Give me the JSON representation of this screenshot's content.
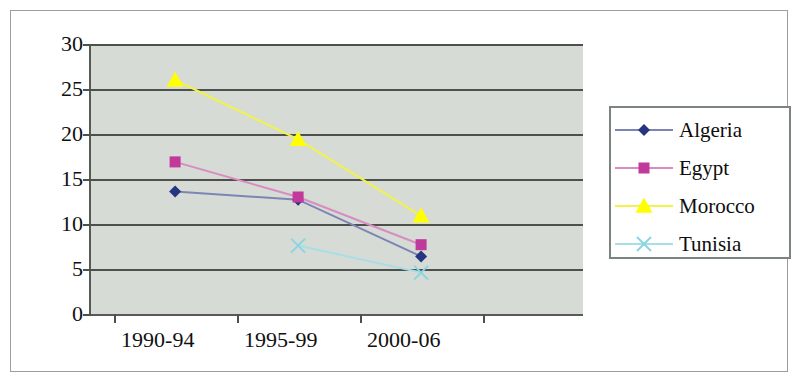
{
  "chart_data": {
    "type": "line",
    "title": "",
    "xlabel": "",
    "ylabel": "",
    "categories": [
      "1990-94",
      "1995-99",
      "2000-06"
    ],
    "ylim": [
      0,
      30
    ],
    "yticks": [
      0,
      5,
      10,
      15,
      20,
      25,
      30
    ],
    "ytick_labels": [
      "0",
      "5",
      "10",
      "15",
      "20",
      "25",
      "30"
    ],
    "grid": true,
    "legend_position": "right",
    "series": [
      {
        "name": "Algeria",
        "color": "#26357f",
        "line_color": "#7d85b5",
        "marker": "diamond",
        "values": [
          13.6,
          12.7,
          6.4
        ]
      },
      {
        "name": "Egypt",
        "color": "#c0399b",
        "line_color": "#d98cc0",
        "marker": "square",
        "values": [
          16.9,
          13.0,
          7.7
        ]
      },
      {
        "name": "Morocco",
        "color": "#ffff00",
        "line_color": "#f2f24d",
        "marker": "triangle",
        "values": [
          26.0,
          19.4,
          10.9
        ]
      },
      {
        "name": "Tunisia",
        "color": "#8ad6e0",
        "line_color": "#a8dee6",
        "marker": "x",
        "values": [
          null,
          7.6,
          4.6
        ]
      }
    ]
  },
  "axes": {
    "y_tick_labels": [
      "30",
      "25",
      "20",
      "15",
      "10",
      "5",
      "0"
    ],
    "x_tick_labels": [
      "1990-94",
      "1995-99",
      "2000-06"
    ]
  },
  "legend": {
    "entries": [
      {
        "label": "Algeria"
      },
      {
        "label": "Egypt"
      },
      {
        "label": "Morocco"
      },
      {
        "label": "Tunisia"
      }
    ]
  },
  "colors": {
    "plot_background": "#d6dbd6",
    "gridline": "#4c514c",
    "axis": "#4c514c",
    "figure_border": "#9aa09a",
    "legend_border": "#7d837d",
    "text": "#101010"
  }
}
